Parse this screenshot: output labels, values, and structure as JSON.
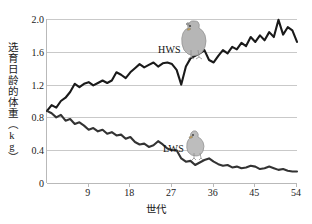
{
  "chart_data": {
    "type": "line",
    "title": "",
    "xlabel": "世代",
    "ylabel": "选育日龄的体重（kg）",
    "xlim": [
      0,
      54
    ],
    "ylim": [
      0,
      2.0
    ],
    "grid": true,
    "legend_position": "inline-annotation",
    "x_ticks": [
      9,
      18,
      27,
      36,
      45,
      54
    ],
    "y_ticks": [
      "0",
      "0.4",
      "0.8",
      "1.2",
      "1.6",
      "2.0"
    ],
    "y_tick_values": [
      0,
      0.4,
      0.8,
      1.2,
      1.6,
      2.0
    ],
    "annotations": [
      {
        "text": "HWS",
        "x": 30,
        "y": 1.62,
        "icon": "chicken-large-icon"
      },
      {
        "text": "LWS",
        "x": 31,
        "y": 0.45,
        "icon": "chick-small-icon"
      }
    ],
    "x": [
      0,
      1,
      2,
      3,
      4,
      5,
      6,
      7,
      8,
      9,
      10,
      11,
      12,
      13,
      14,
      15,
      16,
      17,
      18,
      19,
      20,
      21,
      22,
      23,
      24,
      25,
      26,
      27,
      28,
      29,
      30,
      31,
      32,
      33,
      34,
      35,
      36,
      37,
      38,
      39,
      40,
      41,
      42,
      43,
      44,
      45,
      46,
      47,
      48,
      49,
      50,
      51,
      52,
      53,
      54
    ],
    "series": [
      {
        "name": "HWS",
        "color": "#1a1a1a",
        "values": [
          0.88,
          0.95,
          0.92,
          1.0,
          1.04,
          1.11,
          1.21,
          1.17,
          1.21,
          1.23,
          1.19,
          1.22,
          1.25,
          1.22,
          1.25,
          1.35,
          1.32,
          1.28,
          1.35,
          1.4,
          1.45,
          1.41,
          1.44,
          1.47,
          1.42,
          1.46,
          1.47,
          1.45,
          1.38,
          1.2,
          1.42,
          1.52,
          1.55,
          1.58,
          1.62,
          1.5,
          1.47,
          1.55,
          1.62,
          1.58,
          1.66,
          1.63,
          1.71,
          1.67,
          1.78,
          1.72,
          1.8,
          1.74,
          1.84,
          1.78,
          1.99,
          1.81,
          1.9,
          1.86,
          1.72
        ]
      },
      {
        "name": "LWS",
        "color": "#333333",
        "values": [
          0.88,
          0.85,
          0.8,
          0.83,
          0.76,
          0.78,
          0.72,
          0.74,
          0.7,
          0.65,
          0.67,
          0.63,
          0.65,
          0.6,
          0.62,
          0.58,
          0.59,
          0.54,
          0.56,
          0.5,
          0.47,
          0.48,
          0.44,
          0.46,
          0.51,
          0.47,
          0.42,
          0.4,
          0.4,
          0.3,
          0.26,
          0.27,
          0.22,
          0.25,
          0.28,
          0.3,
          0.26,
          0.23,
          0.21,
          0.22,
          0.19,
          0.2,
          0.18,
          0.19,
          0.21,
          0.2,
          0.17,
          0.18,
          0.2,
          0.18,
          0.16,
          0.17,
          0.15,
          0.14,
          0.14
        ]
      }
    ]
  }
}
